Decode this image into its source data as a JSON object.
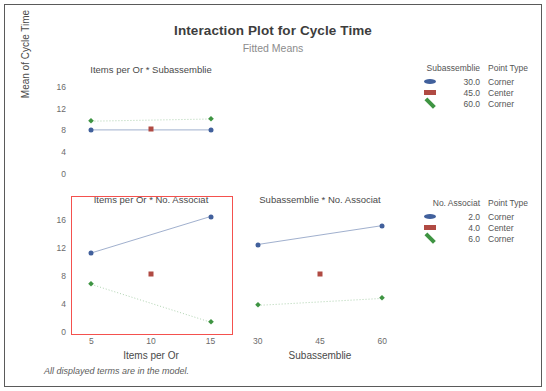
{
  "chart_data": {
    "type": "scatter",
    "title": "Interaction Plot for Cycle Time",
    "subtitle": "Fitted Means",
    "ylabel": "Mean of Cycle Time",
    "footnote": "All displayed terms are in the model.",
    "grid": false,
    "ylim": [
      0,
      18
    ],
    "yticks": [
      0,
      4,
      8,
      12,
      16
    ],
    "panels": [
      {
        "id": "items-subassemblie",
        "title": "Items per Or * Subassemblie",
        "row": 0,
        "col": 0,
        "xlabel": "Items per Or",
        "xticks": [
          5,
          10,
          15
        ],
        "xlim": [
          3.2,
          16.8
        ],
        "highlighted": false,
        "series": [
          {
            "name": "30.0",
            "point_type": "Corner",
            "marker": "circle",
            "color": "#41609c",
            "line": "solid",
            "x": [
              5,
              15
            ],
            "values": [
              8.1,
              8.1
            ]
          },
          {
            "name": "45.0",
            "point_type": "Center",
            "marker": "square",
            "color": "#b04a43",
            "line": "none",
            "x": [
              10
            ],
            "values": [
              8.25
            ]
          },
          {
            "name": "60.0",
            "point_type": "Corner",
            "marker": "diamond",
            "color": "#3e9442",
            "line": "dotted",
            "x": [
              5,
              15
            ],
            "values": [
              9.7,
              10.1
            ]
          }
        ]
      },
      {
        "id": "items-associat",
        "title": "Items per Or * No. Associat",
        "row": 1,
        "col": 0,
        "xlabel": "Items per Or",
        "xticks": [
          5,
          10,
          15
        ],
        "xlim": [
          3.2,
          16.8
        ],
        "highlighted": true,
        "series": [
          {
            "name": "2.0",
            "point_type": "Corner",
            "marker": "circle",
            "color": "#41609c",
            "line": "solid",
            "x": [
              5,
              15
            ],
            "values": [
              11.3,
              16.5
            ]
          },
          {
            "name": "4.0",
            "point_type": "Center",
            "marker": "square",
            "color": "#b04a43",
            "line": "none",
            "x": [
              10
            ],
            "values": [
              8.25
            ]
          },
          {
            "name": "6.0",
            "point_type": "Corner",
            "marker": "diamond",
            "color": "#3e9442",
            "line": "dotted",
            "x": [
              5,
              15
            ],
            "values": [
              6.8,
              1.4
            ]
          }
        ]
      },
      {
        "id": "subassemblie-associat",
        "title": "Subassemblie * No. Associat",
        "row": 1,
        "col": 1,
        "xlabel": "Subassemblie",
        "xticks": [
          30,
          45,
          60
        ],
        "xlim": [
          25.5,
          64.5
        ],
        "highlighted": false,
        "series": [
          {
            "name": "2.0",
            "point_type": "Corner",
            "marker": "circle",
            "color": "#41609c",
            "line": "solid",
            "x": [
              30,
              60
            ],
            "values": [
              12.5,
              15.2
            ]
          },
          {
            "name": "4.0",
            "point_type": "Center",
            "marker": "square",
            "color": "#b04a43",
            "line": "none",
            "x": [
              45
            ],
            "values": [
              8.25
            ]
          },
          {
            "name": "6.0",
            "point_type": "Corner",
            "marker": "diamond",
            "color": "#3e9442",
            "line": "dotted",
            "x": [
              30,
              60
            ],
            "values": [
              3.8,
              4.8
            ]
          }
        ]
      }
    ],
    "legends": [
      {
        "id": "subassemblie",
        "header_1": "Subassemblie",
        "header_2": "Point Type",
        "entries": [
          {
            "value": "30.0",
            "point_type": "Corner",
            "marker": "circle",
            "color": "#41609c"
          },
          {
            "value": "45.0",
            "point_type": "Center",
            "marker": "square",
            "color": "#b04a43"
          },
          {
            "value": "60.0",
            "point_type": "Corner",
            "marker": "diamond",
            "color": "#3e9442"
          }
        ]
      },
      {
        "id": "no-associat",
        "header_1": "No. Associat",
        "header_2": "Point Type",
        "entries": [
          {
            "value": "2.0",
            "point_type": "Corner",
            "marker": "circle",
            "color": "#41609c"
          },
          {
            "value": "4.0",
            "point_type": "Center",
            "marker": "square",
            "color": "#b04a43"
          },
          {
            "value": "6.0",
            "point_type": "Corner",
            "marker": "diamond",
            "color": "#3e9442"
          }
        ]
      }
    ],
    "colors": {
      "corner_low": "#41609c",
      "center": "#b04a43",
      "corner_high": "#3e9442",
      "highlight": "#f4514e"
    }
  }
}
